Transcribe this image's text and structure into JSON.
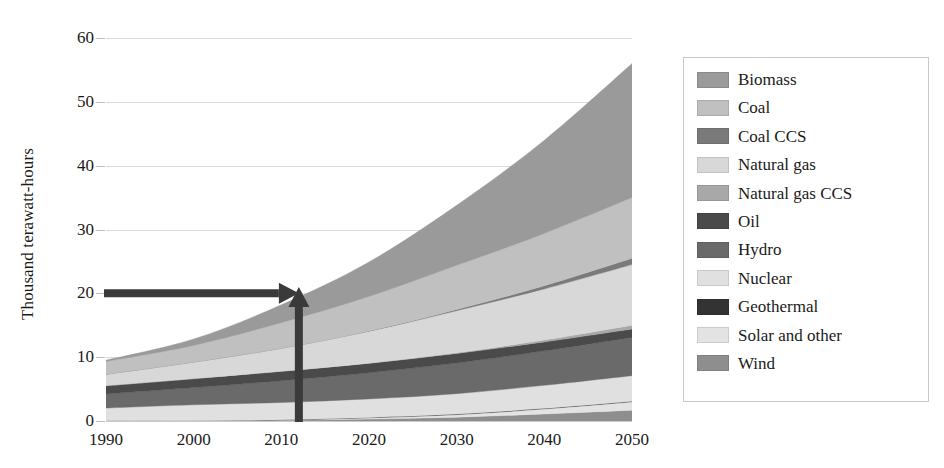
{
  "chart_data": {
    "type": "area",
    "stacked": true,
    "title": "",
    "subtitle": "",
    "xlabel": "",
    "ylabel": "Thousand terawatt-hours",
    "xlim": [
      1990,
      2050
    ],
    "ylim": [
      0,
      60
    ],
    "ytick_values": [
      0,
      10,
      20,
      30,
      40,
      50,
      60
    ],
    "ytick_labels": [
      "0",
      "10",
      "20",
      "30",
      "40",
      "50",
      "60"
    ],
    "xtick_values": [
      1990,
      2000,
      2010,
      2020,
      2030,
      2040,
      2050
    ],
    "xtick_labels": [
      "1990",
      "2000",
      "2010",
      "2020",
      "2030",
      "2040",
      "2050"
    ],
    "grid": "horizontal",
    "legend_position": "right",
    "x": [
      1990,
      2000,
      2010,
      2020,
      2030,
      2040,
      2050
    ],
    "series": [
      {
        "name": "Wind",
        "color": "#8e8e8e",
        "values": [
          0.0,
          0.0,
          0.1,
          0.3,
          0.6,
          1.1,
          1.7
        ]
      },
      {
        "name": "Solar and other",
        "color": "#e3e3e3",
        "values": [
          0.0,
          0.0,
          0.05,
          0.2,
          0.4,
          0.8,
          1.3
        ]
      },
      {
        "name": "Geothermal",
        "color": "#333333",
        "values": [
          0.03,
          0.04,
          0.05,
          0.06,
          0.08,
          0.09,
          0.1
        ]
      },
      {
        "name": "Nuclear",
        "color": "#e0e0e0",
        "values": [
          2.0,
          2.5,
          2.7,
          2.9,
          3.2,
          3.6,
          4.0
        ]
      },
      {
        "name": "Hydro",
        "color": "#6a6a6a",
        "values": [
          2.2,
          2.7,
          3.4,
          4.1,
          4.8,
          5.4,
          6.0
        ]
      },
      {
        "name": "Oil",
        "color": "#4a4a4a",
        "values": [
          1.3,
          1.4,
          1.5,
          1.5,
          1.5,
          1.4,
          1.3
        ]
      },
      {
        "name": "Natural gas CCS",
        "color": "#a8a8a8",
        "values": [
          0.0,
          0.0,
          0.0,
          0.0,
          0.1,
          0.3,
          0.6
        ]
      },
      {
        "name": "Natural gas",
        "color": "#d8d8d8",
        "values": [
          1.8,
          2.6,
          3.6,
          5.0,
          6.6,
          8.0,
          9.5
        ]
      },
      {
        "name": "Coal CCS",
        "color": "#7a7a7a",
        "values": [
          0.0,
          0.0,
          0.0,
          0.05,
          0.2,
          0.5,
          1.0
        ]
      },
      {
        "name": "Coal",
        "color": "#c0c0c0",
        "values": [
          2.0,
          2.6,
          4.0,
          5.4,
          6.9,
          8.2,
          9.5
        ]
      },
      {
        "name": "Biomass",
        "color": "#9a9a9a",
        "values": [
          0.2,
          1.0,
          2.8,
          5.4,
          9.4,
          14.6,
          21.0
        ]
      }
    ],
    "totals": [
      9.5,
      12.8,
      18.2,
      24.9,
      33.8,
      44.0,
      56.0
    ],
    "annotations": [
      {
        "name": "horizontal-level-arrow",
        "from": [
          1990,
          20
        ],
        "to": [
          2012,
          20
        ],
        "color": "#3a3a3a"
      },
      {
        "name": "vertical-year-arrow",
        "from": [
          2012,
          0
        ],
        "to": [
          2012,
          21
        ],
        "color": "#3a3a3a"
      }
    ]
  },
  "axes": {
    "y_title": "Thousand terawatt-hours",
    "y_ticks": [
      "0",
      "10",
      "20",
      "30",
      "40",
      "50",
      "60"
    ],
    "x_ticks": [
      "1990",
      "2000",
      "2010",
      "2020",
      "2030",
      "2040",
      "2050"
    ]
  },
  "legend": {
    "items": [
      {
        "label": "Biomass",
        "color": "#9a9a9a"
      },
      {
        "label": "Coal",
        "color": "#c0c0c0"
      },
      {
        "label": "Coal CCS",
        "color": "#7a7a7a"
      },
      {
        "label": "Natural gas",
        "color": "#d8d8d8"
      },
      {
        "label": "Natural gas CCS",
        "color": "#a8a8a8"
      },
      {
        "label": "Oil",
        "color": "#4a4a4a"
      },
      {
        "label": "Hydro",
        "color": "#6a6a6a"
      },
      {
        "label": "Nuclear",
        "color": "#e0e0e0"
      },
      {
        "label": "Geothermal",
        "color": "#333333"
      },
      {
        "label": "Solar and other",
        "color": "#e3e3e3"
      },
      {
        "label": "Wind",
        "color": "#8e8e8e"
      }
    ]
  },
  "colors": {
    "background": "#ffffff",
    "text": "#1a1a1a",
    "gridline": "#d9d9d9",
    "annotation": "#3a3a3a",
    "legend_border": "#c8c8c8"
  }
}
